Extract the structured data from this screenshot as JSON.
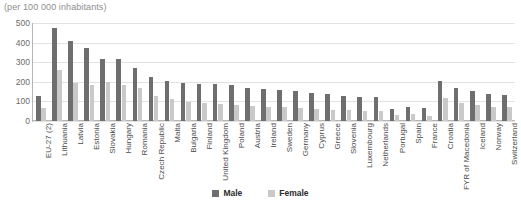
{
  "chart_data": {
    "type": "bar",
    "title": "(per 100 000 inhabitants)",
    "xlabel": "",
    "ylabel": "",
    "ylim": [
      0,
      500
    ],
    "yticks": [
      0,
      100,
      200,
      300,
      400,
      500
    ],
    "grid": true,
    "legend_position": "bottom",
    "categories": [
      "EU-27 (2)",
      "Lithuania",
      "Latvia",
      "Estonia",
      "Slovakia",
      "Hungary",
      "Romania",
      "Czech Republic",
      "Malta",
      "Bulgaria",
      "Finland",
      "United Kingdom",
      "Poland",
      "Austria",
      "Ireland",
      "Sweden",
      "Germany",
      "Cyprus",
      "Greece",
      "Slovenia",
      "Luxembourg",
      "Netherlands",
      "Portugal",
      "Spain",
      "France",
      "Croatia",
      "FYR of Macedonia",
      "Iceland",
      "Norway",
      "Switzerland"
    ],
    "series": [
      {
        "name": "Male",
        "color": "#6e6e6e",
        "values": [
          130,
          473,
          408,
          375,
          318,
          317,
          268,
          224,
          202,
          196,
          190,
          188,
          186,
          170,
          163,
          158,
          155,
          143,
          138,
          128,
          124,
          120,
          60,
          72,
          64,
          205,
          168,
          152,
          140,
          135
        ]
      },
      {
        "name": "Female",
        "color": "#c9c9c9",
        "values": [
          65,
          262,
          195,
          185,
          200,
          185,
          168,
          128,
          110,
          95,
          92,
          88,
          80,
          76,
          72,
          70,
          68,
          60,
          58,
          55,
          52,
          50,
          30,
          34,
          28,
          118,
          92,
          80,
          72,
          70
        ]
      }
    ]
  },
  "legend": {
    "items": [
      {
        "label": "Male",
        "color": "#6e6e6e"
      },
      {
        "label": "Female",
        "color": "#c9c9c9"
      }
    ]
  }
}
